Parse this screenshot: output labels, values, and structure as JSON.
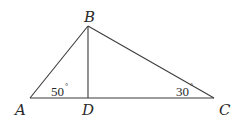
{
  "diagram": {
    "type": "triangle",
    "points": {
      "A": {
        "label": "A",
        "x": 30,
        "y": 98
      },
      "B": {
        "label": "B",
        "x": 88,
        "y": 26
      },
      "C": {
        "label": "C",
        "x": 214,
        "y": 98
      },
      "D": {
        "label": "D",
        "x": 88,
        "y": 98
      }
    },
    "segments": [
      "AB",
      "BC",
      "AC",
      "BD"
    ],
    "angles": {
      "A": {
        "value": "50",
        "unit": "°"
      },
      "C": {
        "value": "30",
        "unit": "°"
      }
    }
  }
}
